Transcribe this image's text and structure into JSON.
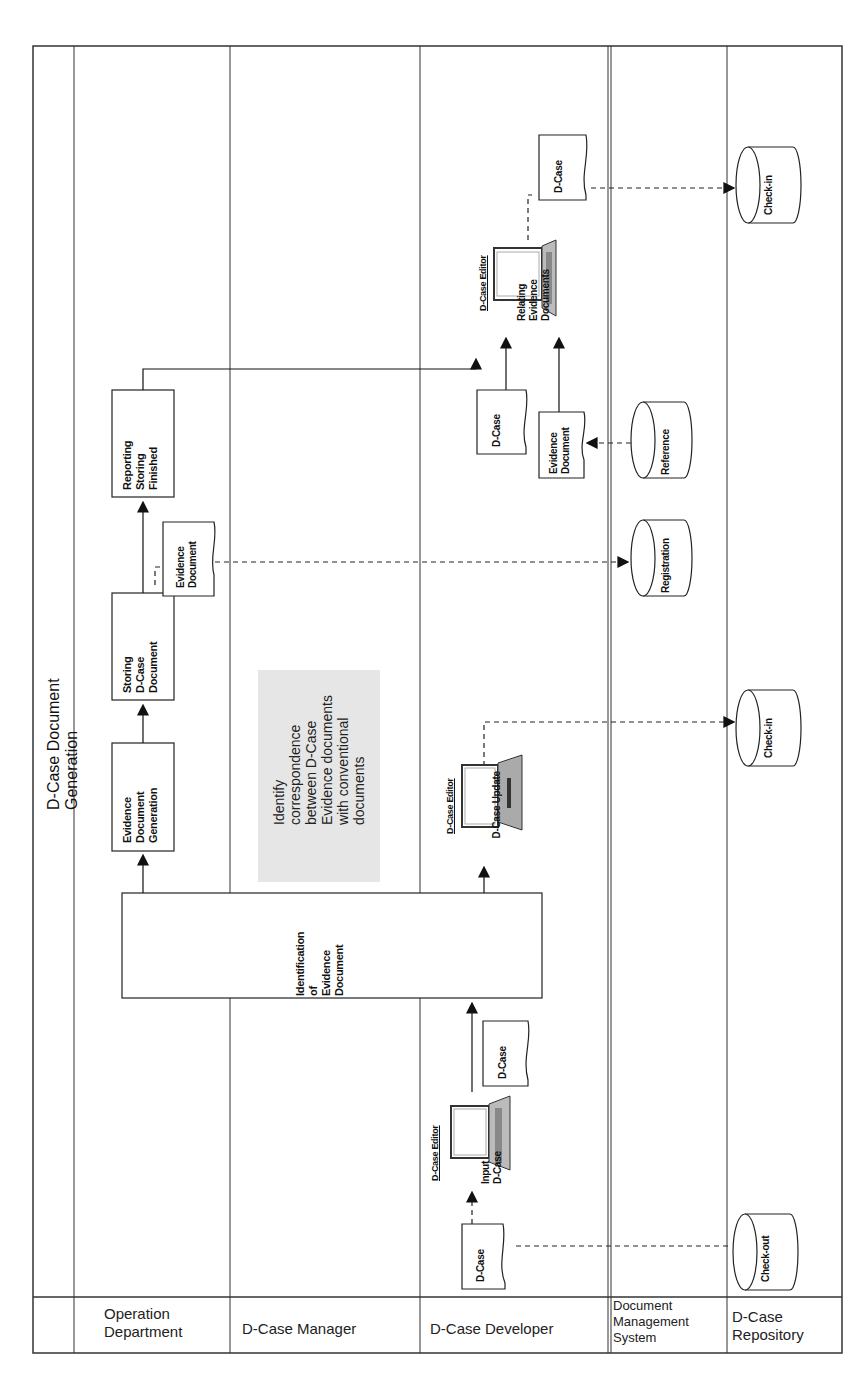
{
  "title": "D-Case Document Generation",
  "lanes": [
    {
      "id": "operation",
      "label": "Operation\nDepartment"
    },
    {
      "id": "manager",
      "label": "D-Case Manager"
    },
    {
      "id": "developer",
      "label": "D-Case Developer"
    },
    {
      "id": "dms",
      "label": "Document\nManagement\nSystem"
    },
    {
      "id": "repository",
      "label": "D-Case\nRepository"
    }
  ],
  "process_boxes": {
    "reporting": "Reporting\nStoring\nFinished",
    "storing": "Storing\nD-Case\nDocument",
    "generation": "Evidence\nDocument\nGeneration",
    "identification": "Identification\nof\nEvidence\nDocument"
  },
  "note": "Identify\ncorrespondence\nbetween D-Case\nEvidence documents\nwith conventional\ndocuments",
  "documents": {
    "evidence_op": "Evidence\nDocument",
    "evidence_dev": "Evidence\nDocument",
    "dcase_top": "D-Case",
    "dcase_relate_in": "D-Case",
    "dcase_mid": "D-Case",
    "dcase_bottom": "D-Case"
  },
  "editors": {
    "relating": {
      "label": "D-Case Editor",
      "caption": "Relating\nEvidence\nDocuments"
    },
    "update": {
      "label": "D-Case Editor",
      "caption": "D-Case Update"
    },
    "input": {
      "label": "D-Case Editor",
      "caption": "Input\nD-Case"
    }
  },
  "datastores": {
    "reference": "Reference",
    "registration": "Registration",
    "checkin_top": "Check-in",
    "checkin_mid": "Check-in",
    "checkout": "Check-out"
  },
  "colors": {
    "line": "#222222",
    "note_bg": "#e6e6e6",
    "screen_gray": "#9a9a9a"
  }
}
